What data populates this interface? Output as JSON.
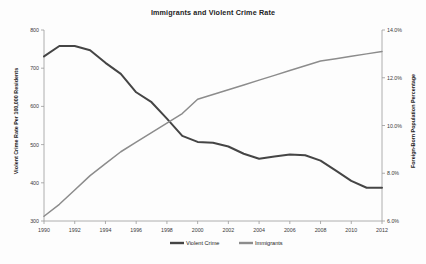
{
  "chart_data": {
    "type": "line",
    "title": "Immigrants and Violent Crime Rate",
    "xlabel": "",
    "ylabel": "Violent Crime Rate Per 100,000 Residents",
    "y2label": "Foreign-Born Population Percentage",
    "grid": false,
    "legend_position": "bottom",
    "x": [
      1990,
      1991,
      1992,
      1993,
      1994,
      1995,
      1996,
      1997,
      1998,
      1999,
      2000,
      2001,
      2002,
      2003,
      2004,
      2005,
      2006,
      2007,
      2008,
      2009,
      2010,
      2011,
      2012
    ],
    "xlim": [
      1990,
      2012
    ],
    "xticks": [
      1990,
      1992,
      1994,
      1996,
      1998,
      2000,
      2002,
      2004,
      2006,
      2008,
      2010,
      2012
    ],
    "xtick_labels": [
      "1990",
      "1992",
      "1994",
      "1996",
      "1998",
      "2000",
      "2002",
      "2004",
      "2006",
      "2008",
      "2010",
      "2012"
    ],
    "ylim": [
      300,
      800
    ],
    "yticks": [
      300,
      400,
      500,
      600,
      700,
      800
    ],
    "ytick_labels": [
      "300",
      "400",
      "500",
      "600",
      "700",
      "800"
    ],
    "y2lim": [
      6.0,
      14.0
    ],
    "y2ticks": [
      6.0,
      8.0,
      10.0,
      12.0,
      14.0
    ],
    "y2tick_labels": [
      "6.0%",
      "8.0%",
      "10.0%",
      "12.0%",
      "14.0%"
    ],
    "series": [
      {
        "name": "Violent Crime",
        "axis": "left",
        "color": "#454545",
        "values": [
          731,
          758,
          758,
          747,
          714,
          685,
          637,
          611,
          568,
          523,
          507,
          505,
          495,
          476,
          463,
          469,
          474,
          472,
          458,
          432,
          405,
          387,
          387
        ]
      },
      {
        "name": "Immigrants",
        "axis": "right",
        "color": "#8c8c8c",
        "values": [
          6.2,
          6.7,
          7.3,
          7.9,
          8.4,
          8.9,
          9.3,
          9.7,
          10.1,
          10.5,
          11.1,
          11.3,
          11.5,
          11.7,
          11.9,
          12.1,
          12.3,
          12.5,
          12.7,
          12.8,
          12.9,
          13.0,
          13.1
        ]
      }
    ],
    "legend": [
      {
        "label": "Violent Crime",
        "color": "#454545"
      },
      {
        "label": "Immigrants",
        "color": "#8c8c8c"
      }
    ]
  }
}
